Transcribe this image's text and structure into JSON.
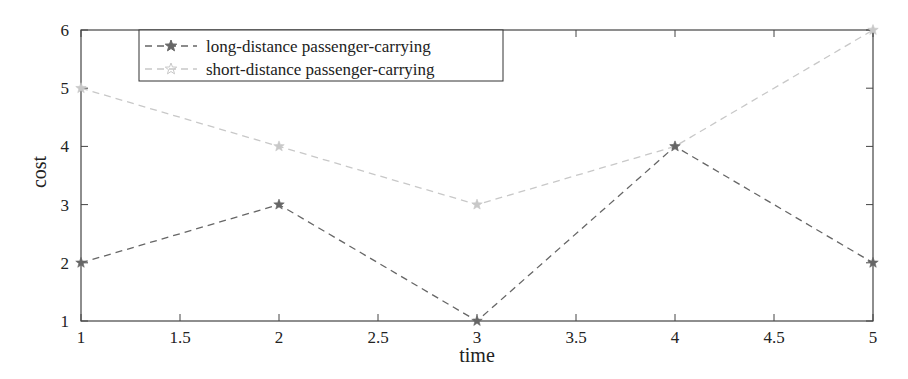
{
  "chart_data": {
    "type": "line",
    "title": "",
    "xlabel": "time",
    "ylabel": "cost",
    "xlim": [
      1,
      5
    ],
    "ylim": [
      1,
      6
    ],
    "x_ticks": [
      "1",
      "1.5",
      "2",
      "2.5",
      "3",
      "3.5",
      "4",
      "4.5",
      "5"
    ],
    "y_ticks": [
      "1",
      "2",
      "3",
      "4",
      "5",
      "6"
    ],
    "grid": false,
    "legend_position": "upper left",
    "x": [
      1,
      2,
      3,
      4,
      5
    ],
    "series": [
      {
        "name": "long-distance passenger-carrying",
        "values": [
          2,
          3,
          1,
          4,
          2
        ],
        "color": "#666666",
        "line_style": "dashed",
        "marker": "star"
      },
      {
        "name": "short-distance passenger-carrying",
        "values": [
          5,
          4,
          3,
          4,
          6
        ],
        "color": "#c8c8c8",
        "line_style": "dashed",
        "marker": "star"
      }
    ]
  }
}
